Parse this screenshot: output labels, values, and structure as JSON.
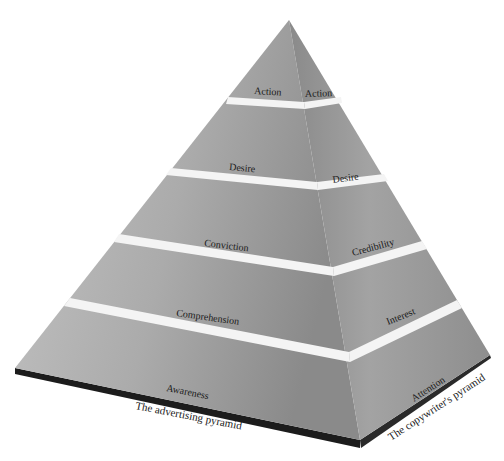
{
  "diagram": {
    "type": "pyramid",
    "colors": {
      "background": "#ffffff",
      "left_face_light": "#b9b9b9",
      "left_face_dark": "#8f8f8f",
      "right_face_light": "#a6a6a6",
      "right_face_dark": "#7d7d7d",
      "band": "#f4f4f4",
      "base_edge": "#1c1c1c",
      "text": "#1a1a1a"
    },
    "left_face": {
      "caption": "The advertising pyramid",
      "levels": [
        {
          "label": "Action"
        },
        {
          "label": "Desire"
        },
        {
          "label": "Conviction"
        },
        {
          "label": "Comprehension"
        },
        {
          "label": "Awareness"
        }
      ]
    },
    "right_face": {
      "caption": "The copywriter's pyramid",
      "levels": [
        {
          "label": "Action"
        },
        {
          "label": "Desire"
        },
        {
          "label": "Credibility"
        },
        {
          "label": "Interest"
        },
        {
          "label": "Attention"
        }
      ]
    }
  }
}
